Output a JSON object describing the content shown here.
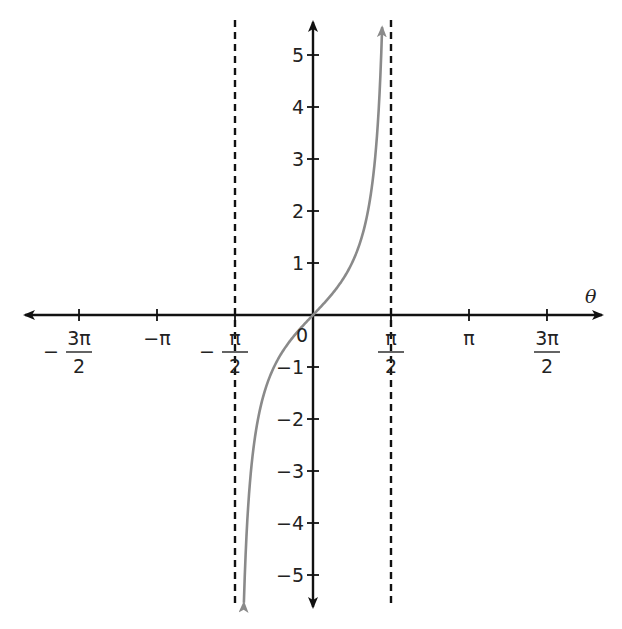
{
  "chart_data": {
    "type": "line",
    "title": "",
    "function": "tan(theta)",
    "xlabel": "θ",
    "ylabel": "",
    "xlim": [
      -5.1,
      5.1
    ],
    "ylim": [
      -5.5,
      5.5
    ],
    "grid": false,
    "x_ticks": [
      {
        "value": -4.712,
        "label_prefix": "−",
        "num": "3π",
        "den": "2",
        "fraction": true
      },
      {
        "value": -3.1416,
        "label": "−π",
        "fraction": false
      },
      {
        "value": -1.5708,
        "label_prefix": "−",
        "num": "π",
        "den": "2",
        "fraction": true
      },
      {
        "value": 1.5708,
        "num": "π",
        "den": "2",
        "fraction": true
      },
      {
        "value": 3.1416,
        "label": "π",
        "fraction": false
      },
      {
        "value": 4.712,
        "num": "3π",
        "den": "2",
        "fraction": true
      }
    ],
    "y_ticks": [
      {
        "value": 5,
        "label": "5"
      },
      {
        "value": 4,
        "label": "4"
      },
      {
        "value": 3,
        "label": "3"
      },
      {
        "value": 2,
        "label": "2"
      },
      {
        "value": 1,
        "label": "1"
      },
      {
        "value": -1,
        "label": "−1"
      },
      {
        "value": -2,
        "label": "−2"
      },
      {
        "value": -3,
        "label": "−3"
      },
      {
        "value": -4,
        "label": "−4"
      },
      {
        "value": -5,
        "label": "−5"
      }
    ],
    "origin_label": "0",
    "asymptotes": [
      -1.5708,
      1.5708
    ],
    "series": [
      {
        "name": "tan θ",
        "color": "#8a8a8a",
        "x_range": [
          -1.392,
          1.392
        ],
        "sample_points": [
          {
            "x": -1.3734,
            "y": -5
          },
          {
            "x": -1.249,
            "y": -3
          },
          {
            "x": -1.1071,
            "y": -2
          },
          {
            "x": -0.7854,
            "y": -1
          },
          {
            "x": 0,
            "y": 0
          },
          {
            "x": 0.7854,
            "y": 1
          },
          {
            "x": 1.1071,
            "y": 2
          },
          {
            "x": 1.249,
            "y": 3
          },
          {
            "x": 1.3734,
            "y": 5
          }
        ]
      }
    ]
  },
  "colors": {
    "axis": "#111111",
    "curve": "#8a8a8a",
    "asymptote": "#111111"
  }
}
